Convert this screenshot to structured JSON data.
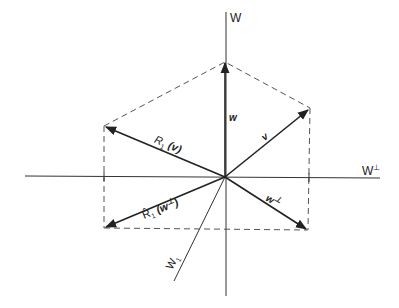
{
  "diagram": {
    "type": "vector-reflection",
    "axes": {
      "vertical": {
        "label": "W"
      },
      "horizontal": {
        "label": "W",
        "label_sup": "⊥"
      },
      "oblique": {
        "label": "W",
        "label_sub": "1"
      }
    },
    "vectors": {
      "w": {
        "label": "w"
      },
      "v": {
        "label": "v"
      },
      "w_perp": {
        "label": "w",
        "label_sup": "⊥"
      },
      "R1_v": {
        "prefix": "R",
        "sub": "1",
        "arg": "v"
      },
      "R1hat_wperp": {
        "prefix": "R̂",
        "sub": "1",
        "arg": "w",
        "arg_sup": "⊥"
      }
    },
    "colors": {
      "line": "#222222",
      "dash": "#555555",
      "background": "#ffffff"
    }
  }
}
